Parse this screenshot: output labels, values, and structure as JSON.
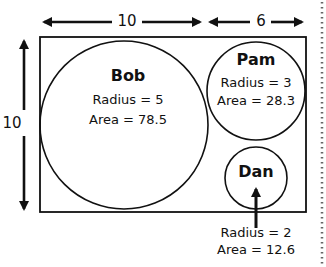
{
  "diagram": {
    "dimensions": {
      "top_left_width": "10",
      "top_right_width": "6",
      "left_height": "10"
    },
    "circles": [
      {
        "name": "Bob",
        "radius_text": "Radius = 5",
        "area_text": "Area = 78.5",
        "radius": 5,
        "area": 78.5
      },
      {
        "name": "Pam",
        "radius_text": "Radius = 3",
        "area_text": "Area = 28.3",
        "radius": 3,
        "area": 28.3
      },
      {
        "name": "Dan",
        "radius_text": "Radius = 2",
        "area_text": "Area = 12.6",
        "radius": 2,
        "area": 12.6
      }
    ],
    "colors": {
      "stroke": "#111111",
      "background": "#ffffff",
      "dotted_border": "#666666"
    }
  }
}
